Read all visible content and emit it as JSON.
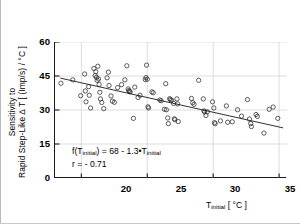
{
  "chart_data": {
    "type": "scatter",
    "title": "",
    "xlabel": "T_initial [ °C ]",
    "ylabel": "Sensitivity to Rapid Step-Like Δ T [ (Imp/s) / °C ]",
    "ylabel_line1": "Sensitivity to",
    "ylabel_line2_pre": "Rapid Step-Like ",
    "ylabel_line2_post": " T [ (Imp/s) / °C ]",
    "delta_symbol": "∆",
    "xlim": [
      18,
      35.6
    ],
    "ylim": [
      0,
      60
    ],
    "xticks": [
      20,
      25,
      30,
      35
    ],
    "yticks": [
      0,
      15,
      30,
      45,
      60
    ],
    "grid": true,
    "legend": "none",
    "marker": "open-circle",
    "fit_line": {
      "label": "linear regression",
      "slope": -1.3,
      "intercept": 68,
      "x_start": 18.4,
      "x_end": 35.3
    },
    "annotation": {
      "equation_prefix": "f(T",
      "equation_sub1": "initial",
      "equation_mid": ") = 68 - 1.3",
      "equation_dot": "•",
      "equation_var": "T",
      "equation_sub2": "initial",
      "equation_full": "f(Tinitial) = 68 - 1.3•Tinitial",
      "correlation": "r = - 0.71"
    },
    "points": [
      [
        18.45,
        41.8
      ],
      [
        19.35,
        43.3
      ],
      [
        19.95,
        36.3
      ],
      [
        20.25,
        45.9
      ],
      [
        20.3,
        38.4
      ],
      [
        20.35,
        33.6
      ],
      [
        20.55,
        40.3
      ],
      [
        20.6,
        36.5
      ],
      [
        20.7,
        30.9
      ],
      [
        20.95,
        48.3
      ],
      [
        21.05,
        45.2
      ],
      [
        21.1,
        46.9
      ],
      [
        21.15,
        44.4
      ],
      [
        21.2,
        43.1
      ],
      [
        21.25,
        49.3
      ],
      [
        21.3,
        43.7
      ],
      [
        21.35,
        41.3
      ],
      [
        21.4,
        37.8
      ],
      [
        21.45,
        34.9
      ],
      [
        21.55,
        33.3
      ],
      [
        21.7,
        30.6
      ],
      [
        21.95,
        44.2
      ],
      [
        22.05,
        46.7
      ],
      [
        22.1,
        40.8
      ],
      [
        22.25,
        36.2
      ],
      [
        22.35,
        33.9
      ],
      [
        22.5,
        33.4
      ],
      [
        22.75,
        39.9
      ],
      [
        23.05,
        41.2
      ],
      [
        23.3,
        43.3
      ],
      [
        23.45,
        49.5
      ],
      [
        23.55,
        39.3
      ],
      [
        23.6,
        38.6
      ],
      [
        23.65,
        38.2
      ],
      [
        23.7,
        38.0
      ],
      [
        23.95,
        26.3
      ],
      [
        24.05,
        40.1
      ],
      [
        24.3,
        35.5
      ],
      [
        24.45,
        36.5
      ],
      [
        24.85,
        43.4
      ],
      [
        24.9,
        44.3
      ],
      [
        24.95,
        49.8
      ],
      [
        25.0,
        43.6
      ],
      [
        25.05,
        31.4
      ],
      [
        25.1,
        30.9
      ],
      [
        25.35,
        38.0
      ],
      [
        25.45,
        37.6
      ],
      [
        25.95,
        34.4
      ],
      [
        26.05,
        34.1
      ],
      [
        26.3,
        30.3
      ],
      [
        26.4,
        41.6
      ],
      [
        26.45,
        30.1
      ],
      [
        26.55,
        26.5
      ],
      [
        26.6,
        24.0
      ],
      [
        26.7,
        35.0
      ],
      [
        26.75,
        34.6
      ],
      [
        26.85,
        34.3
      ],
      [
        27.0,
        32.9
      ],
      [
        27.05,
        26.1
      ],
      [
        27.1,
        25.7
      ],
      [
        27.25,
        34.9
      ],
      [
        27.3,
        32.7
      ],
      [
        27.35,
        24.9
      ],
      [
        28.35,
        35.1
      ],
      [
        28.45,
        33.2
      ],
      [
        28.55,
        32.5
      ],
      [
        28.9,
        43.1
      ],
      [
        29.25,
        34.9
      ],
      [
        29.3,
        29.6
      ],
      [
        29.35,
        29.1
      ],
      [
        29.45,
        27.6
      ],
      [
        29.55,
        29.2
      ],
      [
        29.95,
        33.6
      ],
      [
        30.05,
        30.9
      ],
      [
        30.1,
        24.4
      ],
      [
        30.15,
        23.9
      ],
      [
        30.55,
        25.2
      ],
      [
        31.0,
        31.8
      ],
      [
        31.1,
        24.6
      ],
      [
        31.45,
        24.8
      ],
      [
        31.85,
        30.1
      ],
      [
        32.15,
        27.3
      ],
      [
        32.6,
        34.6
      ],
      [
        32.75,
        26.0
      ],
      [
        32.85,
        24.0
      ],
      [
        32.9,
        22.7
      ],
      [
        33.25,
        28.0
      ],
      [
        33.35,
        27.2
      ],
      [
        33.85,
        19.8
      ],
      [
        34.25,
        30.3
      ],
      [
        34.55,
        31.3
      ],
      [
        34.9,
        26.3
      ]
    ],
    "n_points": 92
  },
  "axis": {
    "ytick_labels": [
      "60",
      "45",
      "30",
      "15",
      "0"
    ],
    "xtick_labels": [
      "20",
      "25",
      "30",
      "35"
    ]
  },
  "xlabel_parts": {
    "main": "T",
    "sub": "initial",
    "units": " [ °C ]"
  }
}
